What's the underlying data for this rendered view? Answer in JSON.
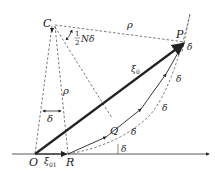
{
  "diagram": {
    "points": {
      "C": "C",
      "P": "P",
      "Q": "Q",
      "O": "O",
      "R": "R"
    },
    "labels": {
      "rho_top": "ρ",
      "rho_left": "ρ",
      "half_N_delta_num": "1",
      "half_N_delta_den": "2",
      "half_N_delta_rest": "Nδ",
      "delta_angle_left": "δ",
      "delta_base": "δ",
      "delta_seg1": "δ",
      "delta_seg2": "δ",
      "delta_seg3": "δ",
      "delta_seg4": "δ",
      "xi0": "ξ",
      "xi0_sub": "0",
      "xi01": "ξ",
      "xi01_sub": "01"
    },
    "colors": {
      "line": "#222222",
      "dashed": "#555555"
    }
  }
}
